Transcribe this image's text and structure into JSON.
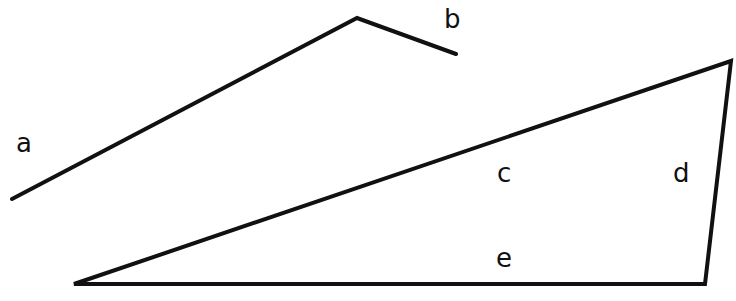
{
  "diagram": {
    "stroke_color": "#111111",
    "background": "#ffffff",
    "polyline_ab": {
      "points": "12,199 357,18 456,54",
      "segments": [
        "a",
        "b"
      ]
    },
    "triangle_cde": {
      "points": "74,284 731,61 705,284",
      "segments": [
        "c",
        "d",
        "e"
      ]
    },
    "labels": {
      "a": "a",
      "b": "b",
      "c": "c",
      "d": "d",
      "e": "e"
    }
  }
}
